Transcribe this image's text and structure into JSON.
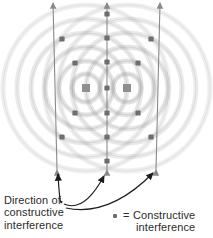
{
  "figure": {
    "name": "two-source-constructive-interference-diagram",
    "background": "#ffffff"
  },
  "labels": {
    "direction": {
      "line1": "Direction of",
      "line2": "constructive",
      "line3": "interference"
    },
    "legend": {
      "equals": "=",
      "line1": "Constructive",
      "line2": "interference"
    }
  },
  "colors": {
    "ink": "#2b2b2b",
    "node_dot": "#6e6e6e",
    "source_marker": "#8f8f8f",
    "wave_ring": "#9a9a9a",
    "antinodal_line": "#8a8a8a",
    "leader_line": "#1c1c1c"
  },
  "chart_data": {
    "type": "scatter",
    "title": "",
    "xlabel": "",
    "ylabel": "",
    "xlim": [
      0,
      213
    ],
    "ylim": [
      0,
      238
    ],
    "grid": false,
    "legend_position": "bottom-right",
    "sources": [
      {
        "name": "source-left",
        "x": 86,
        "y": 88,
        "shape": "square",
        "size": 8
      },
      {
        "name": "source-right",
        "x": 127,
        "y": 88,
        "shape": "square",
        "size": 8
      }
    ],
    "wave_rings": {
      "note": "concentric circular wavefronts radiating from each source",
      "radii": [
        14,
        27,
        41,
        55,
        69,
        83
      ],
      "ring_thickness": 5
    },
    "antinodal_lines": [
      {
        "name": "central-vertical",
        "from": {
          "x": 107,
          "y": 170
        },
        "to": {
          "x": 107,
          "y": 3
        },
        "arrow_top": true,
        "arrow_bottom": true,
        "dots": [
          {
            "x": 107,
            "y": 14
          },
          {
            "x": 107,
            "y": 38
          },
          {
            "x": 107,
            "y": 62
          },
          {
            "x": 107,
            "y": 88
          },
          {
            "x": 107,
            "y": 113
          },
          {
            "x": 107,
            "y": 137
          },
          {
            "x": 107,
            "y": 161
          }
        ]
      },
      {
        "name": "left-diagonal",
        "from": {
          "x": 57,
          "y": 170
        },
        "to": {
          "x": 53,
          "y": 3
        },
        "arrow_top": true,
        "arrow_bottom": true,
        "dots": [
          {
            "x": 62,
            "y": 39
          },
          {
            "x": 75,
            "y": 63
          },
          {
            "x": 75,
            "y": 113
          },
          {
            "x": 62,
            "y": 137
          }
        ]
      },
      {
        "name": "right-diagonal",
        "from": {
          "x": 156,
          "y": 170
        },
        "to": {
          "x": 160,
          "y": 3
        },
        "arrow_top": true,
        "arrow_bottom": true,
        "dots": [
          {
            "x": 151,
            "y": 39
          },
          {
            "x": 138,
            "y": 63
          },
          {
            "x": 138,
            "y": 113
          },
          {
            "x": 151,
            "y": 137
          }
        ]
      }
    ],
    "leader_arrows": [
      {
        "name": "leader-to-left",
        "from": {
          "x": 62,
          "y": 201
        },
        "to": {
          "x": 58,
          "y": 174
        }
      },
      {
        "name": "leader-to-center",
        "from": {
          "x": 64,
          "y": 204
        },
        "to": {
          "x": 104,
          "y": 176
        }
      },
      {
        "name": "leader-to-right",
        "from": {
          "x": 66,
          "y": 208
        },
        "to": {
          "x": 153,
          "y": 173
        }
      }
    ]
  }
}
